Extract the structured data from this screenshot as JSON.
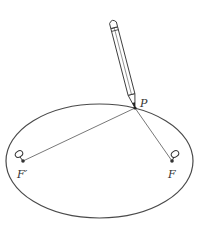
{
  "diagram": {
    "title": "",
    "type": "ellipse-string-construction",
    "colors": {
      "stroke": "#4a4a4a",
      "line": "#555555",
      "pencil": "#3a3a3a",
      "point": "#333333",
      "background": "#ffffff"
    },
    "ellipse": {
      "cx": 99.5,
      "cy": 161,
      "rx": 93.5,
      "ry": 57
    },
    "points": {
      "P": {
        "label": "P",
        "x": 135,
        "y": 108,
        "label_x": 140,
        "label_y": 107
      },
      "F_prime": {
        "label": "F′",
        "x": 23,
        "y": 161,
        "label_x": 17,
        "label_y": 177
      },
      "F": {
        "label": "F",
        "x": 172,
        "y": 161,
        "label_x": 168,
        "label_y": 177
      }
    },
    "pins": [
      {
        "name": "pin-f-prime",
        "cx": 20,
        "cy": 155
      },
      {
        "name": "pin-f",
        "cx": 176,
        "cy": 155
      }
    ],
    "pencil": {
      "eraser_x": 112,
      "eraser_y": 14,
      "tip_x": 135,
      "tip_y": 108
    }
  }
}
